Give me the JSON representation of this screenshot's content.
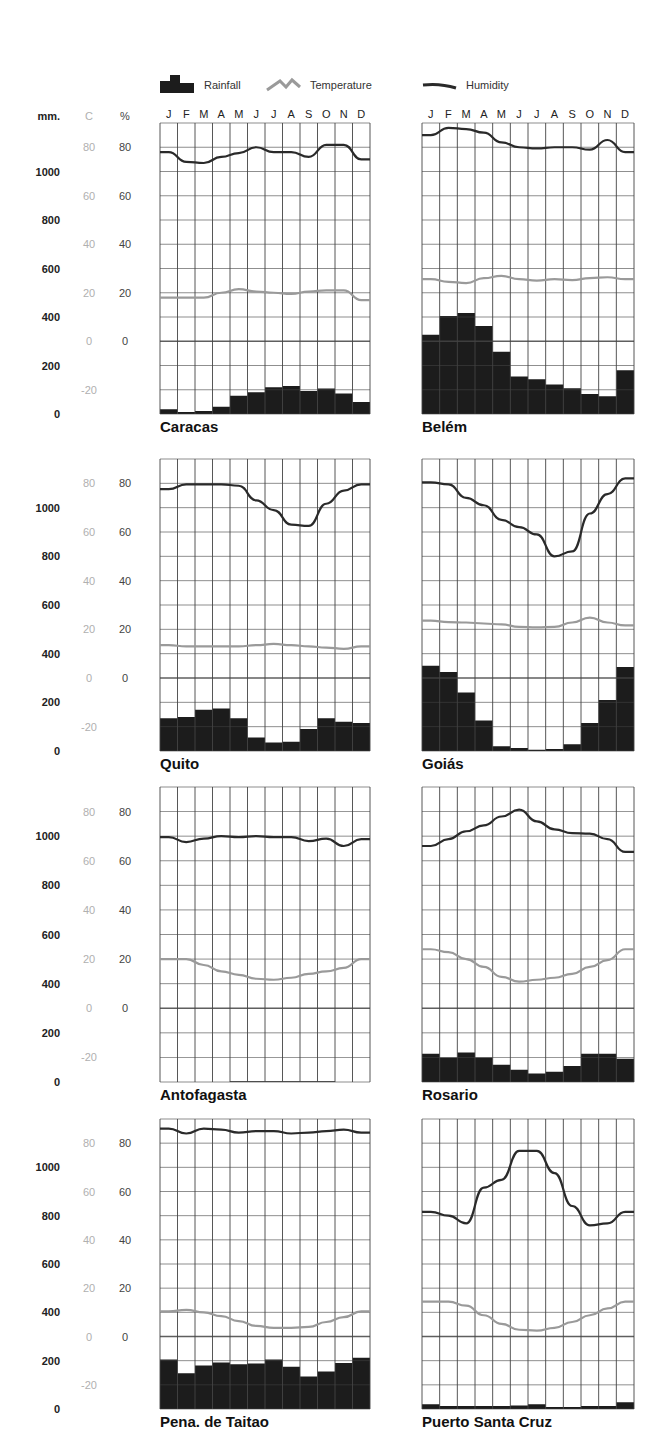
{
  "legend": {
    "rainfall": "Rainfall",
    "temperature": "Temperature",
    "humidity": "Humidity"
  },
  "axis_headers": {
    "mm": "mm.",
    "celsius": "C",
    "percent": "%"
  },
  "months": [
    "J",
    "F",
    "M",
    "A",
    "M",
    "J",
    "J",
    "A",
    "S",
    "O",
    "N",
    "D"
  ],
  "axis_labels": {
    "mm": [
      "1000",
      "800",
      "600",
      "400",
      "200",
      "0"
    ],
    "celsius": [
      "80",
      "60",
      "40",
      "20",
      "0",
      "-20"
    ],
    "percent": [
      "80",
      "60",
      "40",
      "20",
      "0"
    ]
  },
  "colors": {
    "rainfall": "#1c1c1c",
    "temperature": "#9a9a9a",
    "humidity": "#2a2a2a",
    "grid": "#444444"
  },
  "chart_data": [
    {
      "type": "bar+line",
      "title": "Caracas",
      "categories": [
        "J",
        "F",
        "M",
        "A",
        "M",
        "J",
        "J",
        "A",
        "S",
        "O",
        "N",
        "D"
      ],
      "series": [
        {
          "name": "Rainfall (mm)",
          "type": "bar",
          "values": [
            20,
            8,
            12,
            30,
            75,
            90,
            110,
            115,
            95,
            105,
            85,
            50
          ]
        },
        {
          "name": "Temperature (C)",
          "type": "line",
          "values": [
            18,
            18,
            18,
            20,
            21.5,
            20.5,
            20,
            19.5,
            20.5,
            21,
            21,
            17
          ]
        },
        {
          "name": "Humidity (%)",
          "type": "line",
          "values": [
            78,
            74,
            73.5,
            76,
            77.6,
            80,
            78,
            78,
            76,
            81,
            81,
            75
          ]
        }
      ],
      "ylabel_left": "mm.",
      "ylim_mm": [
        0,
        1200
      ],
      "ylim_pct": [
        -30,
        90
      ],
      "grid": true
    },
    {
      "type": "bar+line",
      "title": "Belém",
      "categories": [
        "J",
        "F",
        "M",
        "A",
        "M",
        "J",
        "J",
        "A",
        "S",
        "O",
        "N",
        "D"
      ],
      "series": [
        {
          "name": "Rainfall (mm)",
          "type": "bar",
          "values": [
            327,
            404,
            416,
            363,
            257,
            155,
            143,
            122,
            106,
            82,
            73,
            180
          ]
        },
        {
          "name": "Temperature (C)",
          "type": "line",
          "values": [
            25.6,
            24.5,
            24,
            26,
            27,
            25.6,
            25,
            25.6,
            25.2,
            26,
            26.4,
            25.6
          ]
        },
        {
          "name": "Humidity (%)",
          "type": "line",
          "values": [
            85,
            88,
            87.5,
            86,
            82,
            80,
            79.5,
            80,
            80,
            79,
            83,
            78
          ]
        }
      ],
      "ylim_mm": [
        0,
        1200
      ],
      "ylim_pct": [
        -30,
        90
      ],
      "grid": true
    },
    {
      "type": "bar+line",
      "title": "Quito",
      "categories": [
        "J",
        "F",
        "M",
        "A",
        "M",
        "J",
        "J",
        "A",
        "S",
        "O",
        "N",
        "D"
      ],
      "series": [
        {
          "name": "Rainfall (mm)",
          "type": "bar",
          "values": [
            135,
            140,
            170,
            175,
            135,
            55,
            35,
            38,
            90,
            135,
            120,
            115
          ]
        },
        {
          "name": "Temperature (C)",
          "type": "line",
          "values": [
            13.5,
            13,
            13,
            13,
            13,
            13.5,
            14,
            13.5,
            13,
            12.5,
            12,
            13
          ]
        },
        {
          "name": "Humidity (%)",
          "type": "line",
          "values": [
            77.6,
            79.6,
            79.6,
            79.6,
            79,
            73,
            69,
            63,
            62.5,
            71.6,
            77,
            79.6
          ]
        }
      ],
      "ylim_mm": [
        0,
        1200
      ],
      "ylim_pct": [
        -30,
        90
      ],
      "grid": true
    },
    {
      "type": "bar+line",
      "title": "Goiás",
      "categories": [
        "J",
        "F",
        "M",
        "A",
        "M",
        "J",
        "J",
        "A",
        "S",
        "O",
        "N",
        "D"
      ],
      "series": [
        {
          "name": "Rainfall (mm)",
          "type": "bar",
          "values": [
            350,
            325,
            240,
            125,
            20,
            12,
            5,
            8,
            28,
            115,
            210,
            345
          ]
        },
        {
          "name": "Temperature (C)",
          "type": "line",
          "values": [
            23.6,
            23,
            22.8,
            22.4,
            22,
            21,
            20.8,
            21,
            22.8,
            24.8,
            22.8,
            21.6
          ]
        },
        {
          "name": "Humidity (%)",
          "type": "line",
          "values": [
            80.4,
            79.6,
            74,
            71,
            65,
            62,
            59,
            50,
            52,
            67.6,
            75.6,
            82
          ]
        }
      ],
      "ylim_mm": [
        0,
        1200
      ],
      "ylim_pct": [
        -30,
        90
      ],
      "grid": true
    },
    {
      "type": "bar+line",
      "title": "Antofagasta",
      "categories": [
        "J",
        "F",
        "M",
        "A",
        "M",
        "J",
        "J",
        "A",
        "S",
        "O",
        "N",
        "D"
      ],
      "series": [
        {
          "name": "Rainfall (mm)",
          "type": "bar",
          "values": [
            0,
            0,
            0,
            0,
            3,
            3,
            3,
            3,
            3,
            3,
            0,
            0
          ]
        },
        {
          "name": "Temperature (C)",
          "type": "line",
          "values": [
            20,
            20,
            17.6,
            15,
            13.6,
            12,
            11.6,
            12.4,
            14,
            15,
            16.4,
            20
          ]
        },
        {
          "name": "Humidity (%)",
          "type": "line",
          "values": [
            69.6,
            67.6,
            69,
            70,
            69.6,
            70,
            69.6,
            69.6,
            68,
            69,
            66,
            68.8
          ]
        }
      ],
      "ylim_mm": [
        0,
        1200
      ],
      "ylim_pct": [
        -30,
        90
      ],
      "grid": true
    },
    {
      "type": "bar+line",
      "title": "Rosario",
      "categories": [
        "J",
        "F",
        "M",
        "A",
        "M",
        "J",
        "J",
        "A",
        "S",
        "O",
        "N",
        "D"
      ],
      "series": [
        {
          "name": "Rainfall (mm)",
          "type": "bar",
          "values": [
            115,
            100,
            120,
            100,
            70,
            50,
            35,
            42,
            65,
            115,
            115,
            95
          ]
        },
        {
          "name": "Temperature (C)",
          "type": "line",
          "values": [
            24,
            22.8,
            20,
            16.8,
            12.8,
            10.8,
            11.6,
            12.4,
            14,
            16.8,
            19.6,
            24
          ]
        },
        {
          "name": "Humidity (%)",
          "type": "line",
          "values": [
            66,
            68.8,
            72,
            74.4,
            78,
            80.8,
            76,
            72.8,
            71.2,
            71,
            68.8,
            63.6
          ]
        }
      ],
      "ylim_mm": [
        0,
        1200
      ],
      "ylim_pct": [
        -30,
        90
      ],
      "grid": true
    },
    {
      "type": "bar+line",
      "title": "Pena. de Taitao",
      "categories": [
        "J",
        "F",
        "M",
        "A",
        "M",
        "J",
        "J",
        "A",
        "S",
        "O",
        "N",
        "D"
      ],
      "series": [
        {
          "name": "Rainfall (mm)",
          "type": "bar",
          "values": [
            205,
            148,
            180,
            192,
            185,
            188,
            205,
            175,
            135,
            155,
            190,
            212
          ]
        },
        {
          "name": "Temperature (C)",
          "type": "line",
          "values": [
            10.4,
            11,
            10,
            8.4,
            6.4,
            4.4,
            3.6,
            3.6,
            4,
            6,
            8,
            10.4
          ]
        },
        {
          "name": "Humidity (%)",
          "type": "line",
          "values": [
            86,
            84,
            86,
            85.6,
            84.4,
            85,
            85,
            84,
            84.4,
            85,
            85.6,
            84.4
          ]
        }
      ],
      "ylim_mm": [
        0,
        1200
      ],
      "ylim_pct": [
        -30,
        90
      ],
      "grid": true
    },
    {
      "type": "bar+line",
      "title": "Puerto Santa Cruz",
      "categories": [
        "J",
        "F",
        "M",
        "A",
        "M",
        "J",
        "J",
        "A",
        "S",
        "O",
        "N",
        "D"
      ],
      "series": [
        {
          "name": "Rainfall (mm)",
          "type": "bar",
          "values": [
            20,
            12,
            12,
            12,
            12,
            14,
            20,
            8,
            8,
            12,
            12,
            28
          ]
        },
        {
          "name": "Temperature (C)",
          "type": "line",
          "values": [
            14.4,
            14.4,
            12.8,
            8.8,
            5.2,
            2.8,
            2.4,
            3.6,
            6,
            8.8,
            11.6,
            14.4
          ]
        },
        {
          "name": "Humidity (%)",
          "type": "line",
          "values": [
            51.6,
            50,
            46.8,
            61.6,
            64.8,
            76.8,
            76.8,
            67.6,
            54,
            46,
            46.8,
            51.6
          ]
        }
      ],
      "ylim_mm": [
        0,
        1200
      ],
      "ylim_pct": [
        -30,
        90
      ],
      "grid": true
    }
  ]
}
